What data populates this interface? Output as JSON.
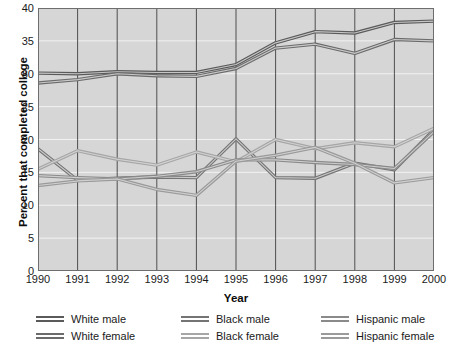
{
  "chart_data": {
    "type": "line",
    "title": "",
    "xlabel": "Year",
    "ylabel": "Percent that completed college",
    "x": [
      1990,
      1991,
      1992,
      1993,
      1994,
      1995,
      1996,
      1997,
      1998,
      1999,
      2000
    ],
    "xlim": [
      1990,
      2000
    ],
    "ylim": [
      0,
      40
    ],
    "yticks": [
      0,
      5,
      10,
      15,
      20,
      25,
      30,
      35,
      40
    ],
    "xticks": [
      1990,
      1991,
      1992,
      1993,
      1994,
      1995,
      1996,
      1997,
      1998,
      1999,
      2000
    ],
    "grid": true,
    "legend_position": "below",
    "legend_columns": 3,
    "series": [
      {
        "name": "White male",
        "color": "#5a5a5a",
        "values": [
          30.1,
          30.0,
          30.3,
          30.2,
          30.2,
          31.4,
          34.7,
          36.4,
          36.2,
          37.8,
          38.0
        ]
      },
      {
        "name": "White female",
        "color": "#6b6b6b",
        "values": [
          28.6,
          29.1,
          30.0,
          29.7,
          29.6,
          30.8,
          33.9,
          34.5,
          33.1,
          35.2,
          35.0
        ]
      },
      {
        "name": "Black male",
        "color": "#747474",
        "values": [
          18.6,
          13.8,
          14.1,
          14.3,
          14.2,
          20.1,
          14.2,
          14.1,
          16.4,
          15.4,
          21.5
        ]
      },
      {
        "name": "Black female",
        "color": "#a6a6a6",
        "values": [
          15.5,
          18.3,
          17.0,
          16.1,
          18.1,
          16.6,
          20.0,
          18.6,
          19.5,
          18.9,
          21.7
        ]
      },
      {
        "name": "Hispanic male",
        "color": "#8a8a8a",
        "values": [
          14.5,
          14.2,
          14.0,
          14.4,
          15.1,
          16.9,
          16.9,
          16.5,
          16.2,
          15.6,
          21.2
        ]
      },
      {
        "name": "Hispanic female",
        "color": "#9a9a9a",
        "values": [
          13.0,
          13.7,
          14.0,
          12.4,
          11.5,
          16.7,
          17.6,
          18.8,
          16.4,
          13.4,
          14.2
        ]
      }
    ]
  },
  "axes": {
    "y_title": "Percent that completed college",
    "x_title": "Year",
    "y_ticks": [
      "0",
      "5",
      "10",
      "15",
      "20",
      "25",
      "30",
      "35",
      "40"
    ],
    "x_ticks": [
      "1990",
      "1991",
      "1992",
      "1993",
      "1994",
      "1995",
      "1996",
      "1997",
      "1998",
      "1999",
      "2000"
    ]
  },
  "legend": {
    "columns": [
      [
        {
          "label": "White male",
          "color": "#5a5a5a"
        },
        {
          "label": "White female",
          "color": "#6b6b6b"
        }
      ],
      [
        {
          "label": "Black male",
          "color": "#747474"
        },
        {
          "label": "Black female",
          "color": "#a6a6a6"
        }
      ],
      [
        {
          "label": "Hispanic male",
          "color": "#8a8a8a"
        },
        {
          "label": "Hispanic female",
          "color": "#9a9a9a"
        }
      ]
    ]
  },
  "style": {
    "plot_background": "#d6d6d6",
    "grid_color": "#f2f2f2",
    "axis_color": "#6e6e6e",
    "text_color": "#1a1a1a"
  }
}
